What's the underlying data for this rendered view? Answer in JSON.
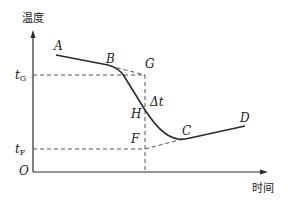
{
  "axes": {
    "y_label": "温度",
    "x_label": "时间",
    "origin": "O"
  },
  "ticks": {
    "tG": {
      "main": "t",
      "sub": "G"
    },
    "tF": {
      "main": "t",
      "sub": "F"
    }
  },
  "points": {
    "A": "A",
    "B": "B",
    "G": "G",
    "H": "H",
    "C": "C",
    "D": "D",
    "F": "F",
    "delta_t": "Δt"
  },
  "colors": {
    "line": "#2a2a2a",
    "dash": "#555555"
  }
}
